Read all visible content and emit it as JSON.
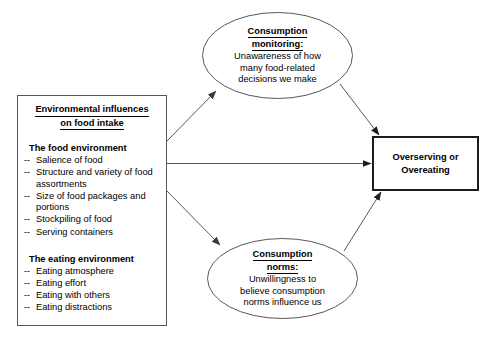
{
  "diagram": {
    "stroke_color": "#58585a",
    "outcome_stroke_color": "#1c1c1c",
    "background": "#ffffff"
  },
  "env_box": {
    "title_line1": "Environmental influences",
    "title_line2": "on food intake",
    "groups": [
      {
        "heading": "The food environment",
        "items": [
          "Salience of food",
          "Structure and variety of food assortments",
          "Size of food packages and portions",
          "Stockpiling of food",
          "Serving containers"
        ]
      },
      {
        "heading": "The eating environment",
        "items": [
          "Eating atmosphere",
          "Eating effort",
          "Eating with others",
          "Eating distractions"
        ]
      }
    ],
    "bullet_marker": "--"
  },
  "monitoring_node": {
    "title_line1": "Consumption",
    "title_line2": "monitoring:",
    "body_line1": "Unawareness of how",
    "body_line2": "many food-related",
    "body_line3": "decisions we make"
  },
  "norms_node": {
    "title_line1": "Consumption",
    "title_line2": "norms:",
    "body_line1": "Unwillingness to",
    "body_line2": "believe consumption",
    "body_line3": "norms influence us"
  },
  "outcome_box": {
    "line1": "Overserving or",
    "line2": "Overeating"
  },
  "edges": [
    {
      "name": "env-to-monitoring",
      "from": "env_box",
      "to": "monitoring_node",
      "style": "solid-arrow"
    },
    {
      "name": "env-to-outcome",
      "from": "env_box",
      "to": "outcome_box",
      "style": "solid-arrow"
    },
    {
      "name": "env-to-norms",
      "from": "env_box",
      "to": "norms_node",
      "style": "solid-arrow"
    },
    {
      "name": "monitoring-to-outcome",
      "from": "monitoring_node",
      "to": "outcome_box",
      "style": "solid-arrow"
    },
    {
      "name": "norms-to-outcome",
      "from": "norms_node",
      "to": "outcome_box",
      "style": "solid-arrow"
    }
  ]
}
